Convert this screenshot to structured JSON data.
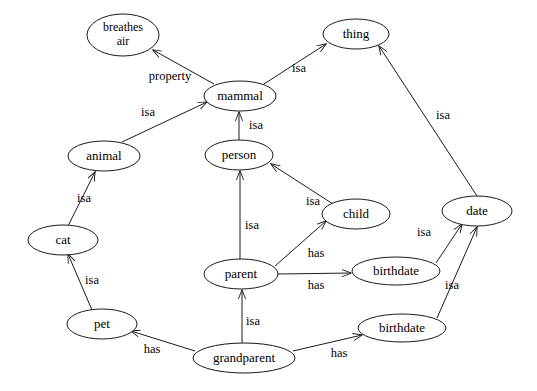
{
  "diagram": {
    "kind": "semantic-network",
    "background_color": "#ffffff",
    "stroke_color": "#1a1a1a",
    "text_color": "#000000",
    "nodes": [
      {
        "id": "breathes_air",
        "label": "breathes air",
        "line1": "breathes",
        "line2": "air",
        "cx": 123,
        "cy": 35,
        "rx": 36,
        "ry": 21
      },
      {
        "id": "thing",
        "label": "thing",
        "line1": "thing",
        "line2": "",
        "cx": 356,
        "cy": 34,
        "rx": 33,
        "ry": 15
      },
      {
        "id": "mammal",
        "label": "mammal",
        "line1": "mammal",
        "line2": "",
        "cx": 240,
        "cy": 96,
        "rx": 36,
        "ry": 15
      },
      {
        "id": "animal",
        "label": "animal",
        "line1": "animal",
        "line2": "",
        "cx": 104,
        "cy": 156,
        "rx": 36,
        "ry": 15
      },
      {
        "id": "person",
        "label": "person",
        "line1": "person",
        "line2": "",
        "cx": 239,
        "cy": 155,
        "rx": 34,
        "ry": 15
      },
      {
        "id": "child",
        "label": "child",
        "line1": "child",
        "line2": "",
        "cx": 356,
        "cy": 214,
        "rx": 34,
        "ry": 15
      },
      {
        "id": "date",
        "label": "date",
        "line1": "date",
        "line2": "",
        "cx": 477,
        "cy": 211,
        "rx": 35,
        "ry": 15
      },
      {
        "id": "cat",
        "label": "cat",
        "line1": "cat",
        "line2": "",
        "cx": 63,
        "cy": 240,
        "rx": 35,
        "ry": 15
      },
      {
        "id": "parent",
        "label": "parent",
        "line1": "parent",
        "line2": "",
        "cx": 241,
        "cy": 274,
        "rx": 37,
        "ry": 15
      },
      {
        "id": "birthdate_1",
        "label": "birthdate",
        "line1": "birthdate",
        "line2": "",
        "cx": 396,
        "cy": 271,
        "rx": 44,
        "ry": 14
      },
      {
        "id": "pet",
        "label": "pet",
        "line1": "pet",
        "line2": "",
        "cx": 102,
        "cy": 324,
        "rx": 35,
        "ry": 15
      },
      {
        "id": "birthdate_2",
        "label": "birthdate",
        "line1": "birthdate",
        "line2": "",
        "cx": 402,
        "cy": 328,
        "rx": 44,
        "ry": 14
      },
      {
        "id": "grandparent",
        "label": "grandparent",
        "line1": "grandparent",
        "line2": "",
        "cx": 244,
        "cy": 358,
        "rx": 51,
        "ry": 15
      }
    ],
    "edges": [
      {
        "id": "e1",
        "from": "mammal",
        "to": "breathes_air",
        "label": "property",
        "lx": 170,
        "ly": 77,
        "x1": 214,
        "y1": 84,
        "x2": 153,
        "y2": 50
      },
      {
        "id": "e2",
        "from": "mammal",
        "to": "thing",
        "label": "isa",
        "lx": 299,
        "ly": 69,
        "x1": 264,
        "y1": 84,
        "x2": 326,
        "y2": 44
      },
      {
        "id": "e3",
        "from": "animal",
        "to": "mammal",
        "label": "isa",
        "lx": 148,
        "ly": 113,
        "x1": 122,
        "y1": 142,
        "x2": 207,
        "y2": 102
      },
      {
        "id": "e4",
        "from": "person",
        "to": "mammal",
        "label": "isa",
        "lx": 256,
        "ly": 126,
        "x1": 239,
        "y1": 140,
        "x2": 239,
        "y2": 112
      },
      {
        "id": "e5",
        "from": "cat",
        "to": "animal",
        "label": "isa",
        "lx": 84,
        "ly": 199,
        "x1": 68,
        "y1": 226,
        "x2": 95,
        "y2": 172
      },
      {
        "id": "e6",
        "from": "child",
        "to": "person",
        "label": "isa",
        "lx": 313,
        "ly": 202,
        "x1": 333,
        "y1": 204,
        "x2": 271,
        "y2": 164
      },
      {
        "id": "e7",
        "from": "pet",
        "to": "cat",
        "label": "isa",
        "lx": 92,
        "ly": 281,
        "x1": 92,
        "y1": 310,
        "x2": 68,
        "y2": 254
      },
      {
        "id": "e8",
        "from": "parent",
        "to": "person",
        "label": "isa",
        "lx": 252,
        "ly": 226,
        "x1": 240,
        "y1": 260,
        "x2": 240,
        "y2": 171
      },
      {
        "id": "e9",
        "from": "parent",
        "to": "child",
        "label": "has",
        "lx": 316,
        "ly": 254,
        "x1": 275,
        "y1": 266,
        "x2": 326,
        "y2": 221
      },
      {
        "id": "e10",
        "from": "parent",
        "to": "birthdate_1",
        "label": "has",
        "lx": 316,
        "ly": 286,
        "x1": 278,
        "y1": 274,
        "x2": 351,
        "y2": 273
      },
      {
        "id": "e11",
        "from": "birthdate_1",
        "to": "date",
        "label": "isa",
        "lx": 424,
        "ly": 233,
        "x1": 436,
        "y1": 263,
        "x2": 462,
        "y2": 224
      },
      {
        "id": "e12",
        "from": "birthdate_2",
        "to": "date",
        "label": "isa",
        "lx": 452,
        "ly": 286,
        "x1": 437,
        "y1": 318,
        "x2": 477,
        "y2": 227
      },
      {
        "id": "e13",
        "from": "date",
        "to": "thing",
        "label": "isa",
        "lx": 443,
        "ly": 116,
        "x1": 477,
        "y1": 196,
        "x2": 379,
        "y2": 46
      },
      {
        "id": "e14",
        "from": "grandparent",
        "to": "pet",
        "label": "has",
        "lx": 152,
        "ly": 350,
        "x1": 195,
        "y1": 351,
        "x2": 131,
        "y2": 331
      },
      {
        "id": "e15",
        "from": "grandparent",
        "to": "parent",
        "label": "isa",
        "lx": 253,
        "ly": 322,
        "x1": 242,
        "y1": 343,
        "x2": 242,
        "y2": 290
      },
      {
        "id": "e16",
        "from": "grandparent",
        "to": "birthdate_2",
        "label": "has",
        "lx": 339,
        "ly": 354,
        "x1": 293,
        "y1": 351,
        "x2": 362,
        "y2": 335
      }
    ]
  }
}
